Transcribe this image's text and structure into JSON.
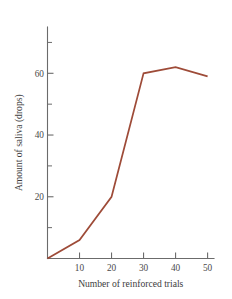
{
  "chart_data": {
    "type": "line",
    "title": "",
    "xlabel": "Number of reinforced trials",
    "ylabel": "Amount of saliva (drops)",
    "x": [
      0,
      10,
      20,
      30,
      40,
      50
    ],
    "values": [
      0,
      6,
      20,
      60,
      62,
      59
    ],
    "series": [
      {
        "name": "Amount of saliva",
        "values": [
          0,
          6,
          20,
          60,
          62,
          59
        ]
      }
    ],
    "xlim": [
      0,
      52
    ],
    "ylim": [
      0,
      75
    ],
    "xticks": [
      10,
      20,
      30,
      40,
      50
    ],
    "xtick_labels": [
      "10",
      "20",
      "30",
      "40",
      "50"
    ],
    "yticks": [
      20,
      40,
      60
    ],
    "ytick_labels": [
      "20",
      "40",
      "60"
    ],
    "yticks_minor": [
      10,
      30,
      50,
      70
    ],
    "grid": false,
    "legend": false,
    "legend_position": "none",
    "line_color": "#9e4b38",
    "axis_color": "#6b6b6b",
    "text_color": "#3d3d3d",
    "background_color": "#ffffff"
  }
}
